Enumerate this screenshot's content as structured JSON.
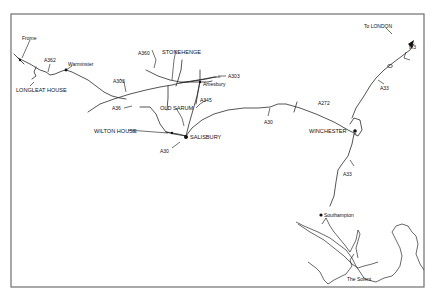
{
  "map": {
    "places": {
      "frome": "Frome",
      "warminster": "Warminster",
      "longleat": "LONGLEAT HOUSE",
      "stonehenge": "STONEHENGE",
      "amesbury": "Amesbury",
      "old_sarum": "OLD SARUM",
      "wilton": "WILTON HOUSE",
      "salisbury": "SALISBURY",
      "winchester": "WINCHESTER",
      "london": "To LONDON",
      "southampton": "Southampton",
      "solent": "The Solent"
    },
    "roads": {
      "a362": "A362",
      "a360": "A360",
      "a303_west": "A303",
      "a303_east": "A303",
      "a36": "A36",
      "a345": "A345",
      "a30_south": "A30",
      "a30_east": "A30",
      "a272": "A272",
      "a33_north": "A33",
      "a33_south": "A33",
      "m3": "M3"
    },
    "colors": {
      "ink": "#111111",
      "frame": "#6e6e6e",
      "background": "#ffffff"
    }
  }
}
